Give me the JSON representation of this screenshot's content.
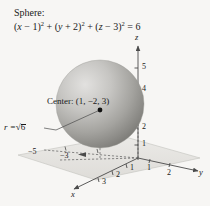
{
  "figure": {
    "background_color": "#f7f6f4",
    "caption": {
      "line1": "Sphere:",
      "equation_plain": "(x − 1)² + (y + 2)² + (z − 3)² = 6",
      "terms": {
        "open1": "(",
        "var1": "x",
        "op1": " − 1",
        "close1": ")",
        "exp1": "2",
        "plus1": " + (",
        "var2": "y",
        "op2": " + 2",
        "close2": ")",
        "exp2": "2",
        "plus2": " + (",
        "var3": "z",
        "op3": " − 3",
        "close3": ")",
        "exp3": "2",
        "equals": " = 6"
      }
    },
    "annotations": {
      "center_label": "Center: (1, −2, 3)",
      "radius_prefix": "r =",
      "radius_value": "6",
      "radius_symbol": "√"
    },
    "sphere": {
      "center_px": {
        "x": 100,
        "y": 104
      },
      "radius_px": 44,
      "fill_light": "#d8d7d5",
      "fill_mid": "#b4b3b1",
      "fill_dark": "#84837f",
      "center_dot_color": "#111111"
    },
    "plane": {
      "fill_color": "#e4e3e0",
      "edge_color": "#b9b8b4"
    },
    "axes": {
      "line_color": "#4a4a4a",
      "z": {
        "name": "z",
        "ticks": [
          "5",
          "4",
          "2",
          "1"
        ]
      },
      "y": {
        "name": "y",
        "ticks": [
          "1",
          "2"
        ]
      },
      "x": {
        "name": "x",
        "ticks": [
          "1",
          "2",
          "3"
        ]
      },
      "negative_ticks": [
        "−5",
        "−3"
      ]
    }
  }
}
